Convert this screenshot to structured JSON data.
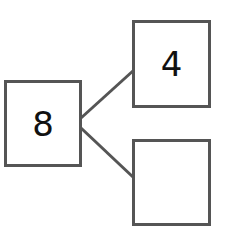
{
  "diagram": {
    "type": "number-bond",
    "whole": {
      "value": "8"
    },
    "parts": [
      {
        "value": "4"
      },
      {
        "value": ""
      }
    ],
    "colors": {
      "stroke": "#555555",
      "text": "#111111",
      "background": "#ffffff"
    }
  }
}
